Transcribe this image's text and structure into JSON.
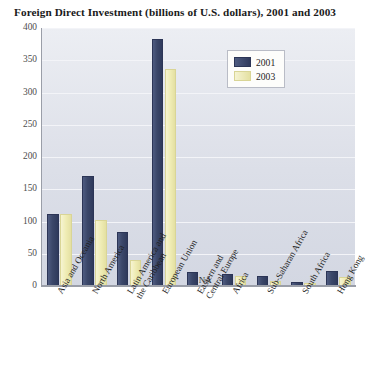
{
  "chart_data": {
    "type": "bar",
    "title": "Foreign Direct Investment (billions of U.S. dollars), 2001 and 2003",
    "xlabel": "",
    "ylabel": "",
    "ylim": [
      0,
      400
    ],
    "yticks": [
      400,
      350,
      300,
      250,
      200,
      150,
      100,
      50,
      0
    ],
    "ytick_labels": [
      "400",
      "350",
      "300",
      "250",
      "200",
      "150",
      "100",
      "50",
      "0"
    ],
    "grid": true,
    "legend_position": "top-right",
    "categories": [
      "Asia and Oceania",
      "North America",
      "Latin America and\nthe Caribbean",
      "European Union",
      "Eastern and\nCentral Europe",
      "Africa",
      "Sub-Saharan Africa",
      "South Africa",
      "Hong Kong"
    ],
    "series": [
      {
        "name": "2001",
        "color": "#3b4769",
        "values": [
          112,
          170,
          83,
          383,
          22,
          18,
          15,
          7,
          24
        ]
      },
      {
        "name": "2003",
        "color": "#efecb4",
        "values": [
          112,
          102,
          40,
          337,
          null,
          15,
          8,
          5,
          14
        ]
      }
    ],
    "annotations": [
      {
        "text": "NA",
        "category": "Eastern and Central Europe",
        "series": "2003"
      }
    ]
  },
  "legend": {
    "items": [
      {
        "label": "2001",
        "swatch": "navy-swatch"
      },
      {
        "label": "2003",
        "swatch": "yellow-swatch"
      }
    ]
  },
  "colors": {
    "series_2001": "#3b4769",
    "series_2003": "#efecb4",
    "plot_background": "#dcdfe8",
    "axis": "#9a9ea8",
    "text": "#1f1f1f"
  }
}
